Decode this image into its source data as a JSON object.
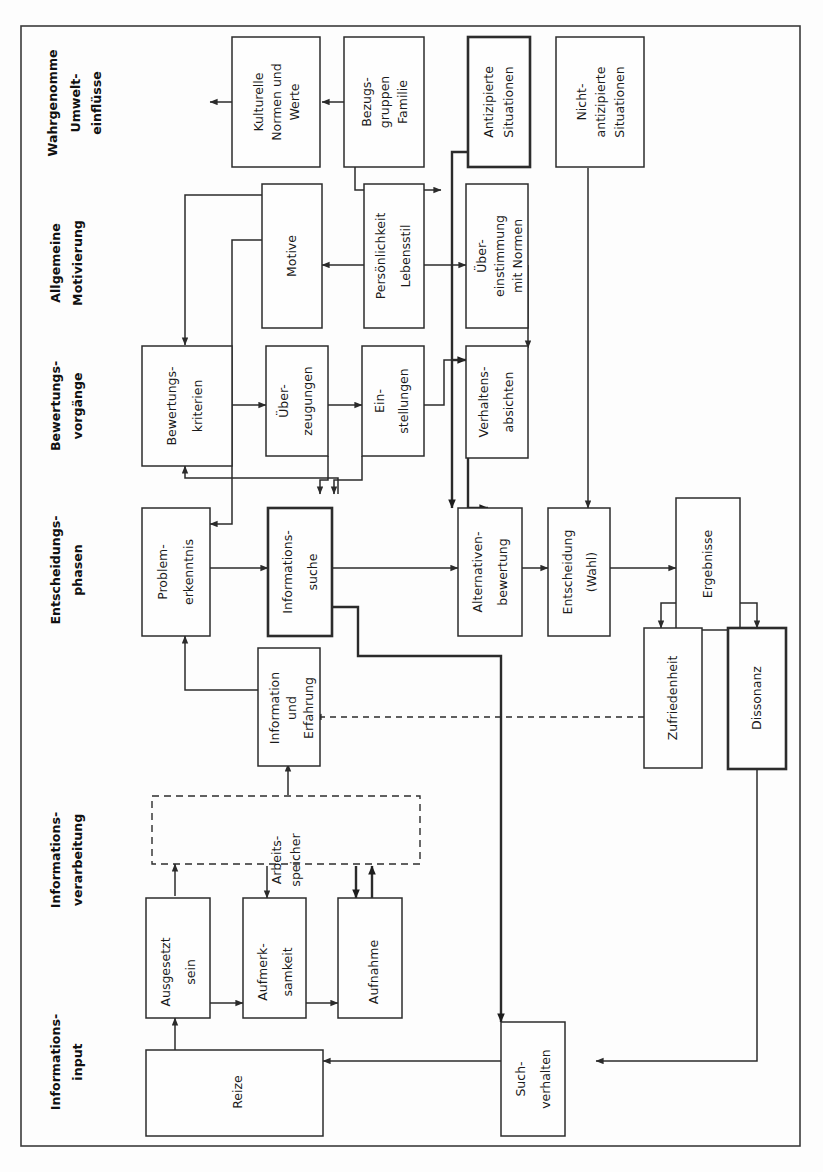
{
  "figure": {
    "orientation": "rotated-90-ccw",
    "background_color": "#fdfdfd",
    "border_color": "#3b3b3b",
    "line_color": "#2b2b2b"
  },
  "bands": [
    {
      "id": "band-umwelt",
      "lines": [
        "Wahrgenomme",
        "Umwelt-",
        "einflüsse"
      ]
    },
    {
      "id": "band-motivierung",
      "lines": [
        "Allgemeine",
        "Motivierung"
      ]
    },
    {
      "id": "band-bewertung",
      "lines": [
        "Bewertungs-",
        "vorgänge"
      ]
    },
    {
      "id": "band-entscheidung",
      "lines": [
        "Entscheidungs-",
        "phasen"
      ]
    },
    {
      "id": "band-verarbeitung",
      "lines": [
        "Informations-",
        "verarbeitung"
      ]
    },
    {
      "id": "band-input",
      "lines": [
        "Informations-",
        "input"
      ]
    }
  ],
  "nodes": [
    {
      "id": "kulturelle-normen",
      "lines": [
        "Kulturelle",
        "Normen und",
        "Werte"
      ],
      "style": "solid"
    },
    {
      "id": "bezugsgruppen",
      "lines": [
        "Bezugs-",
        "gruppen",
        "Familie"
      ],
      "style": "solid"
    },
    {
      "id": "antizipierte",
      "lines": [
        "Antizipierte",
        "Situationen"
      ],
      "style": "heavy"
    },
    {
      "id": "nicht-antizipierte",
      "lines": [
        "Nicht-",
        "antizipierte",
        "Situationen"
      ],
      "style": "solid"
    },
    {
      "id": "motive",
      "lines": [
        "Motive"
      ],
      "style": "solid"
    },
    {
      "id": "persoenlichkeit",
      "lines": [
        "Persönlichkeit",
        "Lebensstil"
      ],
      "style": "solid"
    },
    {
      "id": "uebereinstimmung",
      "lines": [
        "Über-",
        "einstimmung",
        "mit Normen"
      ],
      "style": "solid"
    },
    {
      "id": "bewertungskriterien",
      "lines": [
        "Bewertungs-",
        "kriterien"
      ],
      "style": "solid"
    },
    {
      "id": "ueberzeugungen",
      "lines": [
        "Über-",
        "zeugungen"
      ],
      "style": "solid"
    },
    {
      "id": "einstellungen",
      "lines": [
        "Ein-",
        "stellungen"
      ],
      "style": "solid"
    },
    {
      "id": "verhaltensabsichten",
      "lines": [
        "Verhaltens-",
        "absichten"
      ],
      "style": "solid"
    },
    {
      "id": "problemerkenntnis",
      "lines": [
        "Problem-",
        "erkenntnis"
      ],
      "style": "solid"
    },
    {
      "id": "informationssuche",
      "lines": [
        "Informations-",
        "suche"
      ],
      "style": "heavy"
    },
    {
      "id": "alternativenbewertung",
      "lines": [
        "Alternativen-",
        "bewertung"
      ],
      "style": "solid"
    },
    {
      "id": "entscheidung-wahl",
      "lines": [
        "Entscheidung",
        "(Wahl)"
      ],
      "style": "solid"
    },
    {
      "id": "ergebnisse",
      "lines": [
        "Ergebnisse"
      ],
      "style": "solid"
    },
    {
      "id": "zufriedenheit",
      "lines": [
        "Zufriedenheit"
      ],
      "style": "solid"
    },
    {
      "id": "dissonanz",
      "lines": [
        "Dissonanz"
      ],
      "style": "heavy"
    },
    {
      "id": "information-erfahrung",
      "lines": [
        "Information",
        "und",
        "Erfahrung"
      ],
      "style": "solid"
    },
    {
      "id": "arbeitsspeicher",
      "lines": [
        "Arbeits-",
        "speicher"
      ],
      "style": "dashed"
    },
    {
      "id": "ausgesetzt-sein",
      "lines": [
        "Ausgesetzt",
        "sein"
      ],
      "style": "solid"
    },
    {
      "id": "aufmerksamkeit",
      "lines": [
        "Aufmerk-",
        "samkeit"
      ],
      "style": "solid"
    },
    {
      "id": "aufnahme",
      "lines": [
        "Aufnahme"
      ],
      "style": "solid"
    },
    {
      "id": "reize",
      "lines": [
        "Reize"
      ],
      "style": "solid"
    },
    {
      "id": "suchverhalten",
      "lines": [
        "Such-",
        "verhalten"
      ],
      "style": "solid"
    }
  ],
  "edges": [
    {
      "from": "kulturelle-normen",
      "to": "motive",
      "style": "solid"
    },
    {
      "from": "bezugsgruppen",
      "to": "persoenlichkeit",
      "style": "solid"
    },
    {
      "from": "bezugsgruppen",
      "to": "uebereinstimmung",
      "style": "solid"
    },
    {
      "from": "antizipierte",
      "to": "entscheidung-wahl",
      "style": "thick"
    },
    {
      "from": "antizipierte",
      "to": "verhaltensabsichten",
      "style": "thick"
    },
    {
      "from": "nicht-antizipierte",
      "to": "entscheidung-wahl",
      "style": "solid"
    },
    {
      "from": "persoenlichkeit",
      "to": "motive",
      "style": "solid"
    },
    {
      "from": "persoenlichkeit",
      "to": "uebereinstimmung",
      "style": "solid"
    },
    {
      "from": "motive",
      "to": "bewertungskriterien",
      "style": "solid"
    },
    {
      "from": "motive",
      "to": "problemerkenntnis",
      "style": "solid"
    },
    {
      "from": "uebereinstimmung",
      "to": "verhaltensabsichten",
      "style": "solid"
    },
    {
      "from": "bewertungskriterien",
      "to": "ueberzeugungen",
      "style": "solid"
    },
    {
      "from": "ueberzeugungen",
      "to": "einstellungen",
      "style": "solid"
    },
    {
      "from": "ueberzeugungen",
      "to": "informationssuche",
      "style": "solid"
    },
    {
      "from": "einstellungen",
      "to": "informationssuche",
      "style": "solid"
    },
    {
      "from": "einstellungen",
      "to": "verhaltensabsichten",
      "style": "solid"
    },
    {
      "from": "verhaltensabsichten",
      "to": "entscheidung-wahl",
      "style": "thick"
    },
    {
      "from": "informationssuche",
      "to": "bewertungskriterien",
      "style": "solid"
    },
    {
      "from": "problemerkenntnis",
      "to": "informationssuche",
      "style": "solid"
    },
    {
      "from": "informationssuche",
      "to": "alternativenbewertung",
      "style": "solid"
    },
    {
      "from": "informationssuche",
      "to": "suchverhalten",
      "style": "thick"
    },
    {
      "from": "alternativenbewertung",
      "to": "entscheidung-wahl",
      "style": "solid"
    },
    {
      "from": "entscheidung-wahl",
      "to": "ergebnisse",
      "style": "solid"
    },
    {
      "from": "ergebnisse",
      "to": "zufriedenheit",
      "style": "solid"
    },
    {
      "from": "ergebnisse",
      "to": "dissonanz",
      "style": "solid"
    },
    {
      "from": "zufriedenheit",
      "to": "information-erfahrung",
      "style": "dashed"
    },
    {
      "from": "dissonanz",
      "to": "suchverhalten",
      "style": "solid"
    },
    {
      "from": "information-erfahrung",
      "to": "problemerkenntnis",
      "style": "solid"
    },
    {
      "from": "arbeitsspeicher",
      "to": "information-erfahrung",
      "style": "solid"
    },
    {
      "from": "arbeitsspeicher",
      "to": "aufmerksamkeit",
      "style": "solid"
    },
    {
      "from": "arbeitsspeicher",
      "to": "aufnahme",
      "style": "solid"
    },
    {
      "from": "ausgesetzt-sein",
      "to": "arbeitsspeicher",
      "style": "solid"
    },
    {
      "from": "aufnahme",
      "to": "arbeitsspeicher",
      "style": "solid"
    },
    {
      "from": "ausgesetzt-sein",
      "to": "aufmerksamkeit",
      "style": "solid"
    },
    {
      "from": "aufmerksamkeit",
      "to": "aufnahme",
      "style": "solid"
    },
    {
      "from": "reize",
      "to": "ausgesetzt-sein",
      "style": "solid"
    },
    {
      "from": "suchverhalten",
      "to": "reize",
      "style": "solid"
    }
  ]
}
